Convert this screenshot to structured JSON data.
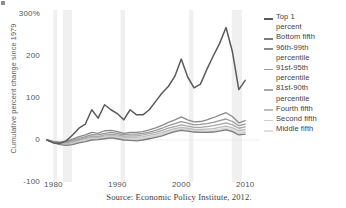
{
  "chart_data": {
    "type": "line",
    "title": "",
    "xlabel": "",
    "ylabel": "Cumulative percent change since 1979",
    "xlim": [
      1979,
      2012
    ],
    "ylim": [
      -100,
      300
    ],
    "grid": false,
    "legend_position": "right",
    "source": "Source: Economic Policy Institute, 2012.",
    "ytick_labels": [
      "300%",
      "200",
      "100",
      "0",
      "-100"
    ],
    "ytick_values": [
      300,
      200,
      100,
      0,
      -100
    ],
    "xtick_labels": [
      "1980",
      "1990",
      "2000",
      "2010"
    ],
    "xtick_values": [
      1980,
      1990,
      2000,
      2010
    ],
    "recession_bands": [
      {
        "start": 1980.0,
        "end": 1980.6
      },
      {
        "start": 1981.5,
        "end": 1982.9
      },
      {
        "start": 1990.5,
        "end": 1991.2
      },
      {
        "start": 2001.2,
        "end": 2001.9
      },
      {
        "start": 2007.9,
        "end": 2009.5
      }
    ],
    "recession_band_color": "#f0f0f0",
    "x": [
      1979,
      1980,
      1981,
      1982,
      1983,
      1984,
      1985,
      1986,
      1987,
      1988,
      1989,
      1990,
      1991,
      1992,
      1993,
      1994,
      1995,
      1996,
      1997,
      1998,
      1999,
      2000,
      2001,
      2002,
      2003,
      2004,
      2005,
      2006,
      2007,
      2008,
      2009,
      2010
    ],
    "series": [
      {
        "name": "Top 1 percent",
        "color": "#5a5a5a",
        "width": 1.5,
        "values": [
          0,
          -7,
          -8,
          -2,
          12,
          28,
          38,
          72,
          52,
          84,
          72,
          63,
          48,
          72,
          60,
          60,
          72,
          92,
          112,
          128,
          152,
          193,
          150,
          124,
          133,
          168,
          200,
          230,
          268,
          210,
          120,
          142
        ]
      },
      {
        "name": "Bottom fifth",
        "color": "#7d7d7d",
        "width": 1.3,
        "values": [
          0,
          -6,
          -11,
          -13,
          -11,
          -7,
          -4,
          0,
          1,
          3,
          5,
          3,
          0,
          -1,
          -2,
          0,
          3,
          6,
          10,
          15,
          20,
          23,
          21,
          19,
          18,
          18,
          19,
          21,
          24,
          20,
          12,
          14
        ]
      },
      {
        "name": "96th-99th percentile",
        "color": "#8a8a8a",
        "width": 1.3,
        "values": [
          0,
          -4,
          -5,
          -3,
          2,
          8,
          12,
          18,
          16,
          22,
          23,
          20,
          16,
          18,
          18,
          20,
          24,
          29,
          35,
          42,
          48,
          55,
          48,
          43,
          44,
          48,
          53,
          59,
          65,
          56,
          41,
          46
        ]
      },
      {
        "name": "91st-95th percentile",
        "color": "#9a9a9a",
        "width": 1.3,
        "values": [
          0,
          -4,
          -6,
          -5,
          -1,
          4,
          8,
          13,
          12,
          16,
          18,
          16,
          13,
          14,
          14,
          16,
          19,
          23,
          28,
          34,
          39,
          44,
          40,
          36,
          37,
          39,
          42,
          46,
          50,
          44,
          34,
          38
        ]
      },
      {
        "name": "81st-90th percentile",
        "color": "#a8a8a8",
        "width": 1.3,
        "values": [
          0,
          -4,
          -7,
          -7,
          -4,
          1,
          5,
          9,
          8,
          12,
          14,
          12,
          9,
          10,
          10,
          12,
          15,
          18,
          23,
          28,
          32,
          36,
          33,
          30,
          30,
          32,
          34,
          37,
          41,
          36,
          28,
          31
        ]
      },
      {
        "name": "Fourth fifth",
        "color": "#bcbcbc",
        "width": 1.3,
        "values": [
          0,
          -5,
          -8,
          -9,
          -6,
          -1,
          3,
          6,
          6,
          9,
          11,
          9,
          6,
          7,
          6,
          8,
          11,
          14,
          18,
          23,
          27,
          30,
          28,
          25,
          25,
          26,
          27,
          30,
          33,
          29,
          22,
          25
        ]
      },
      {
        "name": "Second fifth",
        "color": "#cfcfcf",
        "width": 1.3,
        "values": [
          0,
          -6,
          -10,
          -11,
          -9,
          -5,
          -1,
          2,
          3,
          5,
          7,
          5,
          2,
          2,
          1,
          3,
          6,
          9,
          13,
          18,
          22,
          25,
          23,
          20,
          20,
          20,
          21,
          23,
          26,
          22,
          15,
          18
        ]
      },
      {
        "name": "Middle fifth",
        "color": "#dedede",
        "width": 1.3,
        "values": [
          0,
          -6,
          -9,
          -10,
          -8,
          -3,
          1,
          4,
          4,
          7,
          9,
          7,
          4,
          4,
          3,
          5,
          8,
          11,
          15,
          20,
          24,
          27,
          25,
          22,
          22,
          23,
          24,
          26,
          29,
          25,
          18,
          21
        ]
      }
    ]
  },
  "legend": {
    "items": [
      {
        "label": "Top 1\npercent"
      },
      {
        "label": "Bottom fifth"
      },
      {
        "label": "96th-99th\npercentile"
      },
      {
        "label": "91st-95th\npercentile"
      },
      {
        "label": "81st-90th\npercentile"
      },
      {
        "label": "Fourth fifth"
      },
      {
        "label": "Second fifth"
      },
      {
        "label": "Middle fifth"
      }
    ]
  }
}
